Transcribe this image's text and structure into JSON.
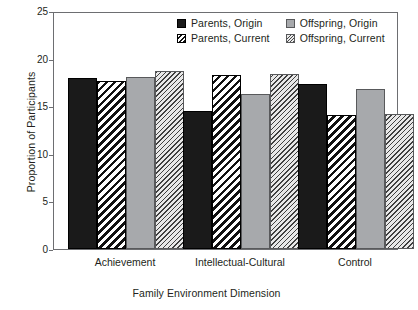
{
  "chart_data": {
    "type": "bar",
    "title": "",
    "xlabel": "Family Environment Dimension",
    "ylabel": "Proportion of Participants",
    "categories": [
      "Achievement",
      "Intellectual-Cultural",
      "Control"
    ],
    "ylim": [
      0,
      25
    ],
    "yticks": [
      0,
      5,
      10,
      15,
      20,
      25
    ],
    "grid": false,
    "legend_position": "top-center",
    "series": [
      {
        "name": "Parents, Origin",
        "pattern": "solid-black",
        "color": "#1a1a1a",
        "values": [
          18.0,
          14.5,
          17.3
        ]
      },
      {
        "name": "Parents, Current",
        "pattern": "bold-diagonal-hatch",
        "color": "#111111",
        "values": [
          17.6,
          18.3,
          14.1
        ]
      },
      {
        "name": "Offspring, Origin",
        "pattern": "solid-gray",
        "color": "#a7a9ac",
        "values": [
          18.1,
          16.3,
          16.8
        ]
      },
      {
        "name": "Offspring, Current",
        "pattern": "fine-diagonal-hatch",
        "color": "#e8e8e8",
        "values": [
          18.7,
          18.4,
          14.2
        ]
      }
    ]
  },
  "axis": {
    "y_tick_labels": [
      "0",
      "5",
      "10",
      "15",
      "20",
      "25"
    ]
  },
  "legend": {
    "entries": [
      {
        "label": "Parents, Origin"
      },
      {
        "label": "Offspring, Origin"
      },
      {
        "label": "Parents, Current"
      },
      {
        "label": "Offspring, Current"
      }
    ]
  }
}
